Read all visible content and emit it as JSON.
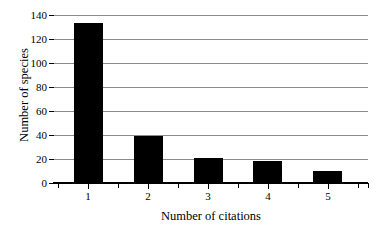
{
  "chart_data": {
    "type": "bar",
    "title": "",
    "subtitle": "",
    "xlabel": "Number of citations",
    "ylabel": "Number of species",
    "categories": [
      "1",
      "2",
      "3",
      "4",
      "5"
    ],
    "values": [
      133,
      39,
      21,
      18,
      10
    ],
    "series": [
      {
        "name": "Number of species",
        "values": [
          133,
          39,
          21,
          18,
          10
        ]
      }
    ],
    "ylim": [
      0,
      140
    ],
    "xlim": [
      0.5,
      5.75
    ],
    "ytick_labels": [
      "0",
      "20",
      "40",
      "60",
      "80",
      "100",
      "120",
      "140"
    ],
    "ytick_values": [
      0,
      20,
      40,
      60,
      80,
      100,
      120,
      140
    ],
    "xtick_labels": [
      "1",
      "2",
      "3",
      "4",
      "5"
    ],
    "grid": "horizontal",
    "legend": "none",
    "bar_color": "#000000",
    "grid_color": "#8a8a8a",
    "axis_color": "#000000",
    "background_color": "#ffffff",
    "annotations": []
  }
}
